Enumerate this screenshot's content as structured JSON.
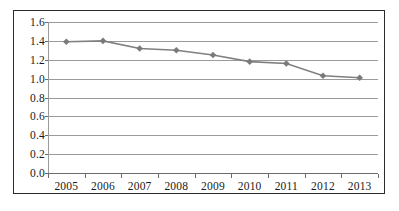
{
  "chart_data": {
    "type": "line",
    "title": "",
    "subtitle": "",
    "xlabel": "",
    "ylabel": "",
    "categories": [
      "2005",
      "2006",
      "2007",
      "2008",
      "2009",
      "2010",
      "2011",
      "2012",
      "2013"
    ],
    "series": [
      {
        "name": "",
        "values": [
          1.39,
          1.4,
          1.32,
          1.3,
          1.25,
          1.18,
          1.16,
          1.03,
          1.01
        ]
      }
    ],
    "ylim": [
      0.0,
      1.6
    ],
    "ytick_labels": [
      "0.0",
      "0.2",
      "0.4",
      "0.6",
      "0.8",
      "1.0",
      "1.2",
      "1.4",
      "1.6"
    ],
    "ytick_values": [
      0.0,
      0.2,
      0.4,
      0.6,
      0.8,
      1.0,
      1.2,
      1.4,
      1.6
    ],
    "grid": true,
    "grid_axis": "y",
    "legend": false,
    "legend_position": "none",
    "marker": "diamond",
    "colors": {
      "line": "#808080",
      "marker": "#7a7a7a",
      "gridline": "#9a9a9a",
      "axis": "#6b6b6b",
      "border": "#2b2b2b",
      "text": "#1a1a1a",
      "background": "#ffffff"
    }
  }
}
